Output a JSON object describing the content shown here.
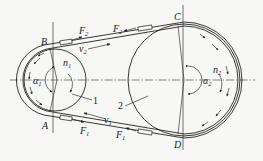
{
  "diagram": {
    "points": {
      "B": "B",
      "A": "A",
      "C": "C",
      "D": "D"
    },
    "labels": {
      "F2_left": {
        "main": "F",
        "sub": "2"
      },
      "v2": {
        "main": "v",
        "sub": "2"
      },
      "F2_right": {
        "main": "F",
        "sub": "2"
      },
      "F1_left": {
        "main": "F",
        "sub": "1"
      },
      "v1": {
        "main": "v",
        "sub": "1"
      },
      "F1_right": {
        "main": "F",
        "sub": "1"
      },
      "n1": {
        "main": "n",
        "sub": "1"
      },
      "n2": {
        "main": "n",
        "sub": "2"
      },
      "alpha1": {
        "main": "α",
        "sub": "1"
      },
      "alpha2": {
        "main": "α",
        "sub": "2"
      }
    },
    "parts": {
      "pulley1": "1",
      "pulley2": "2"
    },
    "colors": {
      "ink": "#222222",
      "background": "#f7f7f5"
    }
  }
}
